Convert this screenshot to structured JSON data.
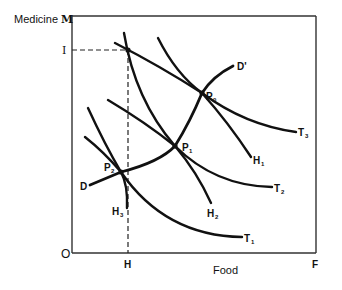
{
  "diagram": {
    "type": "economics-indifference-diagram",
    "axes": {
      "y_label": "Medicine",
      "y_letter": "M",
      "x_label": "Food",
      "x_letter": "F",
      "origin": "O",
      "y_mark": "I",
      "x_mark": "H"
    },
    "curves": {
      "T1": "T",
      "T1_sub": "1",
      "T2": "T",
      "T2_sub": "2",
      "T3": "T",
      "T3_sub": "3",
      "H1": "H",
      "H1_sub": "1",
      "H2": "H",
      "H2_sub": "2",
      "H3": "H",
      "H3_sub": "3",
      "D": "D",
      "D_prime": "D'"
    },
    "points": {
      "P0": "P",
      "P0_sub": "0",
      "P1": "P",
      "P1_sub": "1",
      "P2": "P",
      "P2_sub": "2"
    },
    "colors": {
      "ink": "#111111",
      "frame": "#333333",
      "background": "#ffffff"
    }
  }
}
